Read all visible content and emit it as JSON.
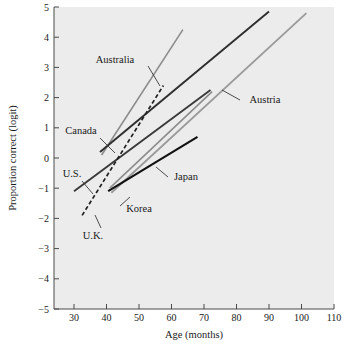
{
  "chart_data": {
    "type": "line",
    "title": "",
    "xlabel": "Age (months)",
    "ylabel": "Proportion correct (logit)",
    "xlim": [
      22,
      113
    ],
    "ylim": [
      -5,
      5
    ],
    "xticks": [
      30,
      40,
      50,
      60,
      70,
      80,
      90,
      100,
      110
    ],
    "yticks": [
      5,
      4,
      3,
      2,
      1,
      0,
      -1,
      -2,
      -3,
      -4,
      -5
    ],
    "grid": false,
    "legend": "inline-annotations",
    "series": [
      {
        "name": "Australia",
        "label": "Australia",
        "style": "solid",
        "color": "#8c8c8c",
        "width": 1.6,
        "x": [
          38.5,
          63.5
        ],
        "y": [
          0.1,
          4.25
        ]
      },
      {
        "name": "Canada",
        "label": "Canada",
        "style": "solid",
        "color": "#2e2e2e",
        "width": 1.9,
        "x": [
          38.0,
          90.0
        ],
        "y": [
          0.2,
          4.85
        ]
      },
      {
        "name": "Austria",
        "label": "Austria",
        "style": "solid",
        "color": "#9a9a9a",
        "width": 1.8,
        "x": [
          41.5,
          101.5
        ],
        "y": [
          -1.15,
          4.8
        ]
      },
      {
        "name": "U.S.",
        "label": "U.S.",
        "style": "solid",
        "color": "#3a3a3a",
        "width": 1.9,
        "x": [
          30.0,
          72.0
        ],
        "y": [
          -1.1,
          2.25
        ]
      },
      {
        "name": "U.K.",
        "label": "U.K.",
        "style": "dashed",
        "color": "#222222",
        "width": 1.7,
        "x": [
          32.5,
          57.5
        ],
        "y": [
          -1.9,
          2.4
        ]
      },
      {
        "name": "Japan",
        "label": "Japan",
        "style": "solid",
        "color": "#111111",
        "width": 2.1,
        "x": [
          40.5,
          68.0
        ],
        "y": [
          -1.1,
          0.7
        ]
      },
      {
        "name": "Korea",
        "label": "Korea",
        "style": "solid",
        "color": "#8c8c8c",
        "width": 1.6,
        "x": [
          41.0,
          72.5
        ],
        "y": [
          -1.0,
          2.2
        ]
      }
    ],
    "annotations": [
      {
        "text": "Australia",
        "x": 341,
        "y": 178
      },
      {
        "text": "Canada",
        "x": 243,
        "y": 382
      },
      {
        "text": "Austria",
        "x": 730,
        "y": 287
      },
      {
        "text": "U.S.",
        "x": 205,
        "y": 521
      },
      {
        "text": "Japan",
        "x": 513,
        "y": 523
      },
      {
        "text": "Korea",
        "x": 358,
        "y": 626
      },
      {
        "text": "U.K.",
        "x": 272,
        "y": 692
      }
    ]
  },
  "axes": {
    "y_axis_title": "Proportion correct (logit)",
    "x_axis_title": "Age (months)",
    "x_tick_labels": [
      "30",
      "40",
      "50",
      "60",
      "70",
      "80",
      "90",
      "100",
      "110"
    ],
    "y_tick_labels": [
      "5",
      "4",
      "3",
      "2",
      "1",
      "0",
      "−1",
      "−2",
      "−3",
      "−4",
      "−5"
    ]
  },
  "labels": {
    "australia": "Australia",
    "canada": "Canada",
    "austria": "Austria",
    "us": "U.S.",
    "uk": "U.K.",
    "japan": "Japan",
    "korea": "Korea"
  },
  "colors": {
    "panel_background": "#ececec",
    "page_background": "#ffffff",
    "axis": "#4a4a4a",
    "dark_line": "#2e2e2e",
    "grey_line": "#8c8c8c",
    "black_line": "#111111"
  }
}
